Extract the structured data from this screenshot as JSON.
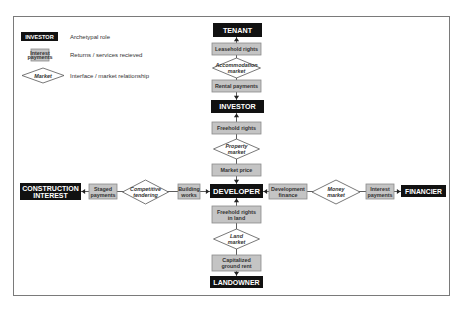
{
  "legend": {
    "items": [
      {
        "sample": "INVESTOR",
        "label": "Archetypal role"
      },
      {
        "sample_lines": [
          "Interest",
          "payments"
        ],
        "label": "Returns / services recieved"
      },
      {
        "sample": "Market",
        "label": "Interface / market relationship"
      }
    ]
  },
  "roles": {
    "tenant": [
      "TENANT"
    ],
    "investor": [
      "INVESTOR"
    ],
    "developer": [
      "DEVELOPER"
    ],
    "landowner": [
      "LANDOWNER"
    ],
    "construction": [
      "CONSTRUCTION",
      "INTEREST"
    ],
    "financier": [
      "FINANCIER"
    ]
  },
  "returns": {
    "leasehold_rights": [
      "Leasehold rights"
    ],
    "rental_payments": [
      "Rental payments"
    ],
    "freehold_rights": [
      "Freehold rights"
    ],
    "market_price": [
      "Market price"
    ],
    "freehold_rights_land": [
      "Freehold rights",
      "in land"
    ],
    "capitalized_ground_rent": [
      "Capitalized",
      "ground rent"
    ],
    "staged_payments": [
      "Staged",
      "payments"
    ],
    "building_works": [
      "Building",
      "works"
    ],
    "development_finance": [
      "Development",
      "finance"
    ],
    "interest_payments": [
      "Interest",
      "payments"
    ]
  },
  "markets": {
    "accommodation": [
      "Accommodation",
      "market"
    ],
    "property": [
      "Property",
      "market"
    ],
    "land": [
      "Land",
      "market"
    ],
    "competitive_tendering": [
      "Competitive",
      "tendering"
    ],
    "money": [
      "Money",
      "market"
    ]
  }
}
